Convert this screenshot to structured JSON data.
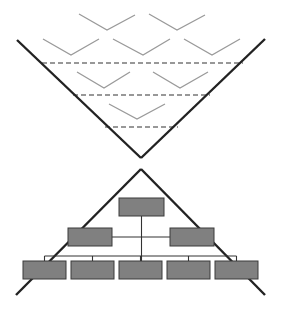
{
  "colors": {
    "background": "#ffffff",
    "funnel_line": "#222222",
    "chevron": "#9a9a9a",
    "dashed": "#333333",
    "box_fill": "#808080",
    "box_stroke": "#3a3a3a",
    "connector": "#333333"
  },
  "funnel": {
    "left_line": [
      17,
      40,
      141,
      158
    ],
    "right_line": [
      265,
      39,
      141,
      158
    ]
  },
  "chevrons": [
    [
      79,
      14,
      107,
      30,
      135,
      15
    ],
    [
      149,
      14,
      177,
      30,
      205,
      15
    ],
    [
      43,
      39,
      71,
      55,
      99,
      39
    ],
    [
      113,
      39,
      143,
      55,
      170,
      39
    ],
    [
      184,
      39,
      212,
      55,
      240,
      39
    ],
    [
      77,
      72,
      104,
      88,
      130,
      72
    ],
    [
      153,
      72,
      180,
      88,
      208,
      72
    ],
    [
      109,
      104,
      137,
      119,
      165,
      104
    ]
  ],
  "dashed_lines": [
    [
      42,
      63,
      243,
      63
    ],
    [
      73,
      95,
      210,
      95
    ],
    [
      105,
      127,
      178,
      127
    ]
  ],
  "pyramid": {
    "apex": [
      141,
      169
    ],
    "left_end": [
      16,
      295
    ],
    "right_end": [
      265,
      295
    ]
  },
  "org_chart": {
    "top": [
      119,
      198,
      45,
      18
    ],
    "middle": [
      [
        68,
        228,
        44,
        18
      ],
      [
        170,
        228,
        44,
        18
      ]
    ],
    "bottom": [
      [
        23,
        261,
        43,
        18
      ],
      [
        71,
        261,
        43,
        18
      ],
      [
        119,
        261,
        43,
        18
      ],
      [
        167,
        261,
        43,
        18
      ],
      [
        215,
        261,
        43,
        18
      ]
    ],
    "bus_y": 256
  }
}
